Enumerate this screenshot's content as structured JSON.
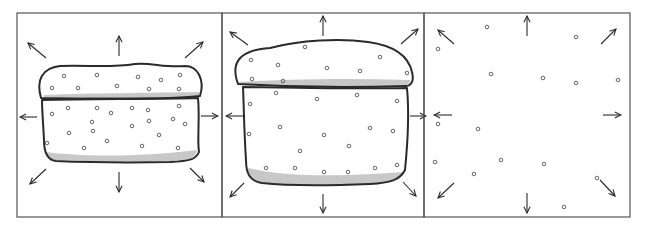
{
  "diagram": {
    "colors": {
      "stroke": "#2a2a2a",
      "frame": "#555555",
      "shade": "#c8c8c8",
      "particle": "#555555",
      "background": "#ffffff"
    },
    "panels": [
      {
        "name": "panel-compact-loaf",
        "x": 17,
        "y": 13,
        "w": 205,
        "h": 204,
        "arrows": [
          [
            46,
            58,
            28,
            43
          ],
          [
            119,
            56,
            119,
            36
          ],
          [
            185,
            58,
            203,
            42
          ],
          [
            37,
            117,
            20,
            117
          ],
          [
            201,
            116,
            218,
            116
          ],
          [
            46,
            169,
            30,
            184
          ],
          [
            119,
            172,
            119,
            192
          ],
          [
            190,
            168,
            204,
            182
          ]
        ],
        "shapes": [
          {
            "d": "M41,98 C36,80 42,68 60,66 C90,65 110,68 135,64 C150,62 165,68 185,66 C198,66 205,80 200,96 C180,99 120,99 41,98 Z"
          },
          {
            "d": "M42,100 C90,99 160,99 198,98 C200,118 197,140 199,152 C196,160 188,161 170,162 C120,163 80,162 56,161 C46,160 44,150 44,140 C43,120 42,110 42,100 Z"
          }
        ],
        "shade_paths": [
          "M44,95 C90,93 150,93 199,92 C200,95 200,96 199,97 C150,98 90,98 44,97 Z",
          "M46,152 C80,157 140,157 197,150 C196,158 190,160 170,161 C120,162 80,161 56,160 C48,159 46,156 46,152 Z"
        ],
        "particles": [
          [
            64,
            76
          ],
          [
            97,
            75
          ],
          [
            138,
            77
          ],
          [
            161,
            80
          ],
          [
            180,
            75
          ],
          [
            52,
            88
          ],
          [
            78,
            88
          ],
          [
            117,
            86
          ],
          [
            149,
            89
          ],
          [
            179,
            89
          ],
          [
            68,
            108
          ],
          [
            97,
            108
          ],
          [
            132,
            108
          ],
          [
            148,
            110
          ],
          [
            179,
            106
          ],
          [
            52,
            114
          ],
          [
            111,
            113
          ],
          [
            92,
            122
          ],
          [
            149,
            121
          ],
          [
            173,
            119
          ],
          [
            185,
            124
          ],
          [
            132,
            126
          ],
          [
            69,
            133
          ],
          [
            93,
            131
          ],
          [
            159,
            135
          ],
          [
            107,
            141
          ],
          [
            47,
            143
          ],
          [
            84,
            148
          ],
          [
            142,
            146
          ],
          [
            178,
            148
          ]
        ]
      },
      {
        "name": "panel-expanded-loaf",
        "x": 222,
        "y": 13,
        "w": 202,
        "h": 204,
        "arrows": [
          [
            323,
            36,
            323,
            16
          ],
          [
            248,
            45,
            230,
            32
          ],
          [
            401,
            44,
            418,
            29
          ],
          [
            244,
            116,
            226,
            116
          ],
          [
            410,
            116,
            426,
            116
          ],
          [
            244,
            183,
            230,
            197
          ],
          [
            323,
            194,
            323,
            213
          ],
          [
            403,
            182,
            416,
            196
          ]
        ],
        "shapes": [
          {
            "d": "M238,84 C230,62 240,50 270,48 C300,40 340,38 368,42 C390,45 408,54 412,72 C414,80 412,86 406,86 C350,88 290,87 238,84 Z"
          },
          {
            "d": "M243,87 C300,88 360,89 407,88 C410,120 407,150 405,170 C400,180 390,183 370,184 C320,186 280,185 262,183 C250,181 246,174 246,160 C244,130 244,110 243,87 Z"
          }
        ],
        "shade_paths": [
          "M238,82 C290,79 350,78 410,80 C412,84 410,86 406,86 C350,88 290,87 240,85 Z",
          "M248,168 C290,178 350,176 404,172 C402,180 392,183 370,184 C320,186 280,185 262,183 C252,181 248,176 248,168 Z"
        ],
        "particles": [
          [
            305,
            47
          ],
          [
            251,
            60
          ],
          [
            278,
            65
          ],
          [
            327,
            68
          ],
          [
            380,
            57
          ],
          [
            360,
            71
          ],
          [
            407,
            73
          ],
          [
            252,
            79
          ],
          [
            283,
            81
          ],
          [
            276,
            93
          ],
          [
            317,
            99
          ],
          [
            357,
            95
          ],
          [
            397,
            101
          ],
          [
            250,
            104
          ],
          [
            280,
            127
          ],
          [
            324,
            135
          ],
          [
            370,
            128
          ],
          [
            393,
            131
          ],
          [
            249,
            134
          ],
          [
            300,
            151
          ],
          [
            349,
            146
          ],
          [
            266,
            168
          ],
          [
            295,
            168
          ],
          [
            324,
            172
          ],
          [
            348,
            172
          ],
          [
            375,
            168
          ],
          [
            397,
            165
          ]
        ]
      },
      {
        "name": "panel-dispersed-particles",
        "x": 424,
        "y": 13,
        "w": 206,
        "h": 204,
        "arrows": [
          [
            527,
            36,
            527,
            16
          ],
          [
            454,
            44,
            438,
            30
          ],
          [
            601,
            44,
            616,
            29
          ],
          [
            452,
            115,
            434,
            115
          ],
          [
            603,
            115,
            621,
            115
          ],
          [
            454,
            183,
            438,
            198
          ],
          [
            527,
            193,
            527,
            213
          ],
          [
            600,
            180,
            615,
            196
          ]
        ],
        "shapes": [],
        "shade_paths": [],
        "particles": [
          [
            487,
            27
          ],
          [
            576,
            37
          ],
          [
            438,
            49
          ],
          [
            491,
            74
          ],
          [
            543,
            78
          ],
          [
            576,
            83
          ],
          [
            618,
            80
          ],
          [
            438,
            124
          ],
          [
            478,
            129
          ],
          [
            435,
            162
          ],
          [
            501,
            160
          ],
          [
            544,
            164
          ],
          [
            474,
            174
          ],
          [
            597,
            178
          ],
          [
            564,
            207
          ]
        ]
      }
    ]
  }
}
